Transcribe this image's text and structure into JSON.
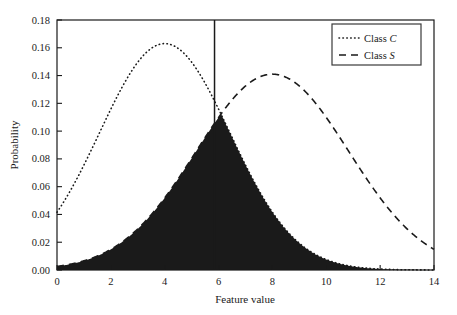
{
  "chart_data": {
    "type": "line",
    "title": "",
    "xlabel": "Feature value",
    "ylabel": "Probability",
    "xlim": [
      0,
      14
    ],
    "ylim": [
      0,
      0.18
    ],
    "xticks": [
      "0",
      "2",
      "4",
      "6",
      "8",
      "10",
      "12",
      "14"
    ],
    "xtick_values": [
      0,
      2,
      4,
      6,
      8,
      10,
      12,
      14
    ],
    "yticks": [
      "0.00",
      "0.02",
      "0.04",
      "0.06",
      "0.08",
      "0.10",
      "0.12",
      "0.14",
      "0.16",
      "0.18"
    ],
    "ytick_values": [
      0,
      0.02,
      0.04,
      0.06,
      0.08,
      0.1,
      0.12,
      0.14,
      0.16,
      0.18
    ],
    "grid": false,
    "legend_position": "top-right",
    "series": [
      {
        "name": "Class C",
        "label_prefix": "Class ",
        "label_italic": "C",
        "style": "dotted",
        "color": "#1a1a1a",
        "distribution": "normal",
        "mean": 4.0,
        "sigma": 2.42,
        "peak_value": 0.163,
        "peak_x": 4.0
      },
      {
        "name": "Class S",
        "label_prefix": "Class ",
        "label_italic": "S",
        "style": "dashed",
        "color": "#1a1a1a",
        "distribution": "normal",
        "mean": 8.0,
        "sigma": 2.83,
        "peak_value": 0.141,
        "peak_x": 8.0
      }
    ],
    "filled_region": {
      "name": "overlap-error-region",
      "description": "minimum of the two class densities",
      "color": "#1a1a1a",
      "peak_value": 0.045,
      "x_start": 0.0,
      "x_end": 14.0
    },
    "decision_boundary": {
      "name": "decision-threshold",
      "x": 5.85,
      "color": "#1a1a1a"
    }
  },
  "legend": {
    "entries": [
      {
        "prefix": "Class ",
        "symbol": "C",
        "style": "dotted"
      },
      {
        "prefix": "Class ",
        "symbol": "S",
        "style": "dashed"
      }
    ]
  },
  "axes": {
    "x_title": "Feature value",
    "y_title": "Probability"
  }
}
